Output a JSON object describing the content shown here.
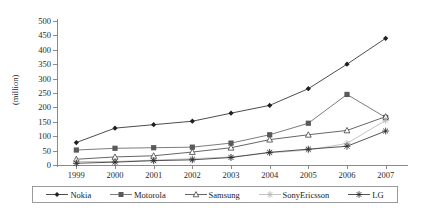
{
  "chart_data": {
    "type": "line",
    "title": "",
    "xlabel": "",
    "ylabel": "(million)",
    "categories": [
      "1999",
      "2000",
      "2001",
      "2002",
      "2003",
      "2004",
      "2005",
      "2006",
      "2007"
    ],
    "ylim": [
      0,
      500
    ],
    "ytick_step": 50,
    "yticks": [
      "0",
      "50",
      "100",
      "150",
      "200",
      "250",
      "300",
      "350",
      "400",
      "450",
      "500"
    ],
    "grid": false,
    "legend_position": "bottom",
    "series": [
      {
        "name": "Nokia",
        "marker": "filled-diamond",
        "color": "#1f1f1f",
        "values": [
          78,
          128,
          140,
          152,
          180,
          207,
          265,
          350,
          440
        ]
      },
      {
        "name": "Motorola",
        "marker": "filled-square",
        "color": "#5a5a5a",
        "values": [
          52,
          58,
          60,
          62,
          76,
          105,
          145,
          245,
          165
        ]
      },
      {
        "name": "Samsung",
        "marker": "open-triangle",
        "color": "#3f3f3f",
        "values": [
          20,
          28,
          32,
          45,
          60,
          88,
          105,
          120,
          168
        ]
      },
      {
        "name": "SonyEricsson",
        "marker": "light-cross",
        "color": "#b5b5b5",
        "values": [
          12,
          12,
          17,
          22,
          28,
          42,
          52,
          75,
          155
        ]
      },
      {
        "name": "LG",
        "marker": "dark-asterisk",
        "color": "#2a2a2a",
        "values": [
          6,
          10,
          15,
          18,
          26,
          44,
          55,
          65,
          118
        ]
      }
    ]
  }
}
